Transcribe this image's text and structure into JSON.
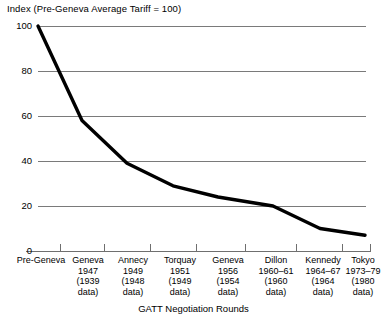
{
  "chart_data": {
    "type": "line",
    "title": "Index (Pre-Geneva Average Tariff = 100)",
    "xlabel": "GATT Negotiation Rounds",
    "ylabel": "",
    "ylim": [
      0,
      100
    ],
    "yticks": [
      0,
      20,
      40,
      60,
      80,
      100
    ],
    "grid": true,
    "legend": "none",
    "categories": [
      "Pre-Geneva",
      "Geneva",
      "Annecy",
      "Torquay",
      "Geneva",
      "Dillon",
      "Kennedy",
      "Tokyo"
    ],
    "category_years": [
      "",
      "1947",
      "1949",
      "1951",
      "1956",
      "1960–61",
      "1964–67",
      "1973–79"
    ],
    "category_data_notes": [
      "",
      "(1939",
      "(1948",
      "(1949",
      "(1954",
      "(1960",
      "(1964",
      "(1980"
    ],
    "category_data_notes2": [
      "",
      "data)",
      "data)",
      "data)",
      "data)",
      "data)",
      "data)",
      "data)"
    ],
    "values": [
      100,
      58,
      39,
      29,
      24,
      20,
      10,
      7
    ],
    "series": [
      {
        "name": "Average tariff index",
        "values": [
          100,
          58,
          39,
          29,
          24,
          20,
          10,
          7
        ],
        "color": "#000000"
      }
    ]
  },
  "labels": {
    "y": [
      "100",
      "80",
      "60",
      "40",
      "20",
      "0"
    ],
    "x": [
      {
        "name": "Pre-Geneva",
        "year": "",
        "data1": "",
        "data2": ""
      },
      {
        "name": "Geneva",
        "year": "1947",
        "data1": "(1939",
        "data2": "data)"
      },
      {
        "name": "Annecy",
        "year": "1949",
        "data1": "(1948",
        "data2": "data)"
      },
      {
        "name": "Torquay",
        "year": "1951",
        "data1": "(1949",
        "data2": "data)"
      },
      {
        "name": "Geneva",
        "year": "1956",
        "data1": "(1954",
        "data2": "data)"
      },
      {
        "name": "Dillon",
        "year": "1960–61",
        "data1": "(1960",
        "data2": "data)"
      },
      {
        "name": "Kennedy",
        "year": "1964–67",
        "data1": "(1964",
        "data2": "data)"
      },
      {
        "name": "Tokyo",
        "year": "1973–79",
        "data1": "(1980",
        "data2": "data)"
      }
    ]
  },
  "colors": {
    "line": "#000000",
    "grid": "#7a7a7a",
    "axis": "#6f6f6f",
    "text": "#000000",
    "background": "#ffffff"
  }
}
